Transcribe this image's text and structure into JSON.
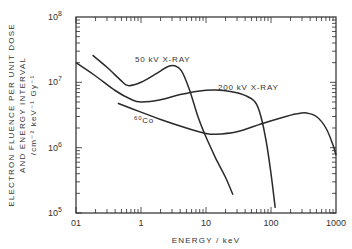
{
  "chart_data": {
    "type": "line",
    "title": "",
    "xlabel": "ENERGY  /  keV",
    "ylabel_lines": [
      "ELECTRON FLUENCE PER UNIT DOSE",
      "AND ENERGY INTERVAL",
      "/cm⁻² keV⁻¹ Gy⁻¹"
    ],
    "xscale": "log",
    "yscale": "log",
    "xlim": [
      0.1,
      1000
    ],
    "ylim": [
      100000,
      100000000
    ],
    "x_ticks": [
      {
        "value": 0.1,
        "label": "01"
      },
      {
        "value": 1,
        "label": "1"
      },
      {
        "value": 10,
        "label": "10"
      },
      {
        "value": 100,
        "label": "100"
      },
      {
        "value": 1000,
        "label": "1000"
      }
    ],
    "y_ticks": [
      {
        "value": 100000,
        "base": "10",
        "exp": "5"
      },
      {
        "value": 1000000,
        "base": "10",
        "exp": "6"
      },
      {
        "value": 10000000,
        "base": "10",
        "exp": "7"
      },
      {
        "value": 100000000,
        "base": "10",
        "exp": "8"
      }
    ],
    "grid": false,
    "legend": "inline annotations",
    "series": [
      {
        "name": "50 kV X-RAY",
        "label": "50 kV  X-RAY",
        "points": [
          [
            0.18,
            26000000
          ],
          [
            0.3,
            17000000
          ],
          [
            0.5,
            10500000
          ],
          [
            0.63,
            8900000
          ],
          [
            1.0,
            10000000
          ],
          [
            1.8,
            14000000
          ],
          [
            2.6,
            17500000
          ],
          [
            3.3,
            18000000
          ],
          [
            4.2,
            15000000
          ],
          [
            5.5,
            8000000
          ],
          [
            7.5,
            3000000
          ],
          [
            9.6,
            1600000
          ],
          [
            14,
            700000
          ],
          [
            20,
            350000
          ],
          [
            26,
            190000
          ]
        ]
      },
      {
        "name": "200 kV X-RAY",
        "label": "200 kV  X-RAY",
        "points": [
          [
            0.1,
            20000000
          ],
          [
            0.2,
            12500000
          ],
          [
            0.4,
            7500000
          ],
          [
            0.7,
            5500000
          ],
          [
            1.0,
            5000000
          ],
          [
            2.0,
            5400000
          ],
          [
            4.0,
            6500000
          ],
          [
            8.0,
            7400000
          ],
          [
            14,
            7600000
          ],
          [
            25,
            7200000
          ],
          [
            40,
            6300000
          ],
          [
            57,
            5000000
          ],
          [
            70,
            3000000
          ],
          [
            85,
            1200000
          ],
          [
            100,
            400000
          ],
          [
            116,
            120000
          ]
        ]
      },
      {
        "name": "60Co",
        "label_super": "60",
        "label_main": "Co",
        "points": [
          [
            0.44,
            4800000
          ],
          [
            1.0,
            3500000
          ],
          [
            2.0,
            2700000
          ],
          [
            5.0,
            2000000
          ],
          [
            10,
            1650000
          ],
          [
            14,
            1600000
          ],
          [
            30,
            1750000
          ],
          [
            70,
            2300000
          ],
          [
            150,
            2900000
          ],
          [
            250,
            3300000
          ],
          [
            350,
            3400000
          ],
          [
            500,
            3000000
          ],
          [
            700,
            2000000
          ],
          [
            900,
            1100000
          ],
          [
            1000,
            770000
          ]
        ]
      }
    ]
  }
}
